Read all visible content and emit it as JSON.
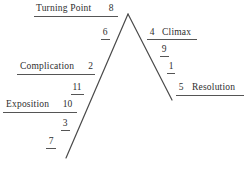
{
  "diagram": {
    "type": "freytag-pyramid",
    "stages": [
      {
        "id": "turning-point",
        "label": "Turning Point",
        "number": "8"
      },
      {
        "id": "complication",
        "label": "Complication",
        "number": "2"
      },
      {
        "id": "exposition",
        "label": "Exposition",
        "number": "10"
      },
      {
        "id": "climax",
        "label": "Climax",
        "number": "4"
      },
      {
        "id": "resolution",
        "label": "Resolution",
        "number": "5"
      }
    ],
    "markers": [
      {
        "id": "marker-6",
        "number": "6"
      },
      {
        "id": "marker-11",
        "number": "11"
      },
      {
        "id": "marker-3",
        "number": "3"
      },
      {
        "id": "marker-7",
        "number": "7"
      },
      {
        "id": "marker-9",
        "number": "9"
      },
      {
        "id": "marker-1",
        "number": "1"
      }
    ],
    "lines": {
      "rising": {
        "from_x": 66,
        "from_y": 158,
        "to_x": 128,
        "to_y": 14
      },
      "falling": {
        "from_x": 128,
        "to_y": 100,
        "to_x": 172,
        "from_y": 14
      }
    },
    "colors": {
      "line": "#4a4a4a",
      "text": "#2e2e2e",
      "rule": "#555555",
      "background": "#ffffff"
    }
  }
}
